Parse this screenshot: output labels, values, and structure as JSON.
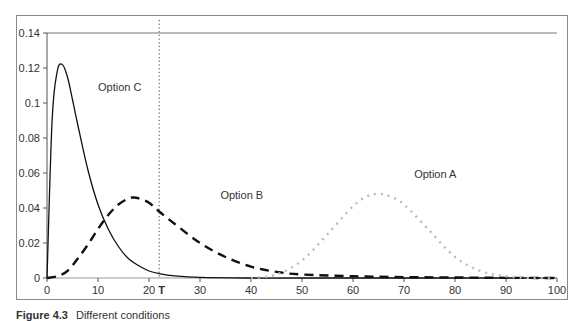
{
  "chart_data": {
    "type": "line",
    "title": "",
    "xlabel": "",
    "ylabel": "",
    "xlim": [
      0,
      100
    ],
    "ylim": [
      0,
      0.14
    ],
    "x_ticks": [
      0,
      10,
      20,
      30,
      40,
      50,
      60,
      70,
      80,
      90,
      100
    ],
    "x_tick_labels": [
      "0",
      "10",
      "20",
      "30",
      "40",
      "50",
      "60",
      "70",
      "80",
      "90",
      "100"
    ],
    "y_ticks": [
      0,
      0.02,
      0.04,
      0.06,
      0.08,
      0.1,
      0.12,
      0.14
    ],
    "y_tick_labels": [
      "0",
      "0.02",
      "0.04",
      "0.06",
      "0.08",
      "0.1",
      "0.12",
      "0.14"
    ],
    "grid": false,
    "legend": null,
    "annotations": [
      {
        "text": "Option C",
        "x": 10,
        "y": 0.107
      },
      {
        "text": "Option B",
        "x": 34,
        "y": 0.045
      },
      {
        "text": "Option A",
        "x": 72,
        "y": 0.057
      },
      {
        "text": "T",
        "x": 22,
        "y": 0,
        "type": "vertical-dotted-line"
      }
    ],
    "series": [
      {
        "name": "Option C",
        "style": "solid",
        "color": "#111111",
        "x": [
          0,
          1,
          2,
          3,
          4,
          5,
          6,
          8,
          10,
          12,
          14,
          16,
          18,
          20,
          22,
          25,
          30,
          40,
          50,
          100
        ],
        "values": [
          0,
          0.09,
          0.118,
          0.122,
          0.115,
          0.102,
          0.088,
          0.062,
          0.042,
          0.028,
          0.018,
          0.011,
          0.007,
          0.004,
          0.0025,
          0.0012,
          0.0003,
          0,
          0,
          0
        ]
      },
      {
        "name": "Option B",
        "style": "dashed",
        "color": "#111111",
        "x": [
          0,
          2,
          4,
          6,
          8,
          10,
          12,
          14,
          16,
          17,
          18,
          20,
          22,
          25,
          30,
          35,
          40,
          45,
          50,
          60,
          70,
          80,
          90,
          100
        ],
        "values": [
          0,
          0.001,
          0.004,
          0.011,
          0.019,
          0.028,
          0.036,
          0.042,
          0.0455,
          0.046,
          0.0455,
          0.043,
          0.038,
          0.031,
          0.02,
          0.012,
          0.0065,
          0.0035,
          0.002,
          0.001,
          0.0005,
          0.0003,
          0.0001,
          0
        ]
      },
      {
        "name": "Option A",
        "style": "dotted",
        "color": "#bbbbbb",
        "x": [
          40,
          45,
          50,
          55,
          60,
          63,
          65,
          67,
          70,
          75,
          80,
          85,
          90,
          95,
          100
        ],
        "values": [
          0,
          0.002,
          0.01,
          0.025,
          0.041,
          0.047,
          0.048,
          0.047,
          0.042,
          0.027,
          0.012,
          0.004,
          0.001,
          0,
          0
        ]
      }
    ]
  },
  "caption": {
    "label": "Figure 4.3",
    "text": "Different conditions"
  }
}
